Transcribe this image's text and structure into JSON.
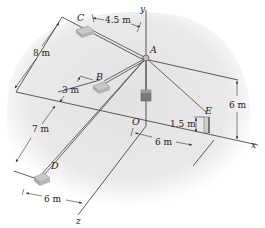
{
  "diagram": {
    "type": "3d-statics-cable-system",
    "axes": {
      "x": "x",
      "y": "y",
      "z": "z"
    },
    "points": {
      "A": "A",
      "B": "B",
      "C": "C",
      "D": "D",
      "E": "E",
      "O": "O"
    },
    "dimensions": {
      "c_offset": "4.5 m",
      "c_to_b": "8 m",
      "b_offset": "3 m",
      "b_to_d": "7 m",
      "d_offset": "6 m",
      "o_to_e": "6 m",
      "e_height": "1.5 m",
      "a_height": "6 m"
    },
    "colors": {
      "background_blob": "#e6e6e6",
      "lines": "#333333",
      "weight": "#777777",
      "anchor": "#bdbdbd"
    }
  }
}
